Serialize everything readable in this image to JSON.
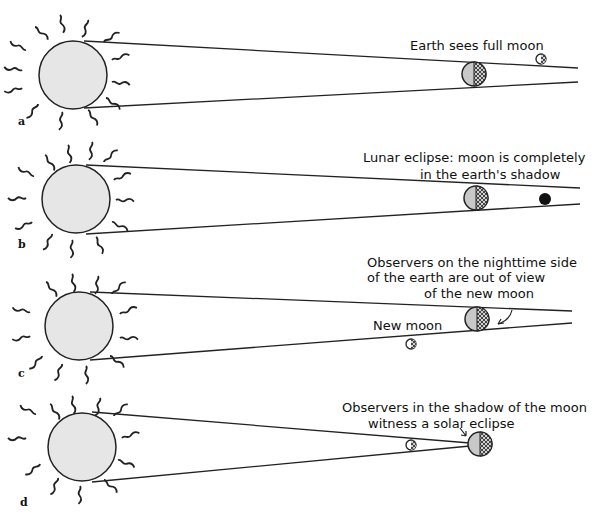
{
  "diagram": {
    "colors": {
      "sun_fill": "#e6e6e6",
      "earth_fill": "#c8c8c8",
      "line": "#222222",
      "eclipsed_moon": "#111111"
    },
    "panels": [
      {
        "id": "a",
        "label": "a",
        "annotation": [
          "Earth sees full moon"
        ],
        "moon_state": "full moon, beyond earth"
      },
      {
        "id": "b",
        "label": "b",
        "annotation": [
          "Lunar eclipse: moon is completely",
          "in the earth's shadow"
        ],
        "moon_state": "eclipsed, in earth's shadow"
      },
      {
        "id": "c",
        "label": "c",
        "annotation": [
          "Observers on the nighttime side",
          "of the earth are out of view",
          "of the new moon"
        ],
        "moon_label": "New moon",
        "moon_state": "new moon, off line"
      },
      {
        "id": "d",
        "label": "d",
        "annotation": [
          "Observers in the shadow of the moon",
          "witness a solar eclipse"
        ],
        "moon_state": "between sun and earth"
      }
    ]
  }
}
